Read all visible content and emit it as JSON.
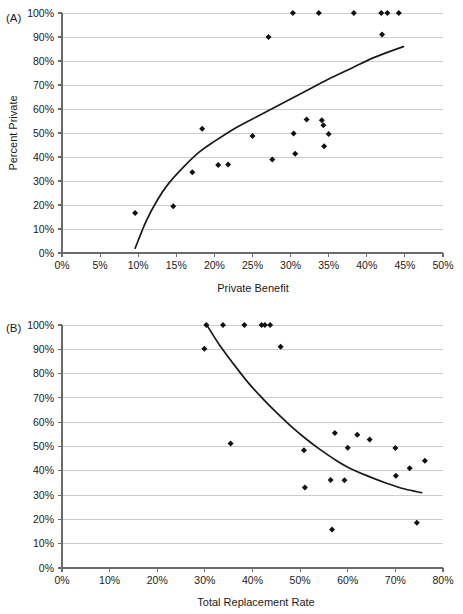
{
  "figure": {
    "background": "#ffffff",
    "marker_color": "#111111",
    "gridline_color": "#c8c8c8",
    "axis_color": "#6b6b6b",
    "fitline_color": "#1a1a1a"
  },
  "panels": [
    {
      "tag": "(A)",
      "xlabel": "Private Benefit",
      "ylabel": "Percent Private",
      "xticks": [
        "0%",
        "5%",
        "10%",
        "15%",
        "20%",
        "25%",
        "30%",
        "35%",
        "40%",
        "45%",
        "50%"
      ],
      "yticks": [
        "0%",
        "10%",
        "20%",
        "30%",
        "40%",
        "50%",
        "60%",
        "70%",
        "80%",
        "90%",
        "100%"
      ]
    },
    {
      "tag": "(B)",
      "xlabel": "Total Replacement Rate",
      "ylabel": "Percent Private",
      "xticks": [
        "0%",
        "10%",
        "20%",
        "30%",
        "40%",
        "50%",
        "60%",
        "70%",
        "80%"
      ],
      "yticks": [
        "0%",
        "10%",
        "20%",
        "30%",
        "40%",
        "50%",
        "60%",
        "70%",
        "80%",
        "90%",
        "100%"
      ]
    }
  ],
  "chart_data": [
    {
      "type": "scatter",
      "panel": "(A)",
      "title": "",
      "xlabel": "Private Benefit",
      "ylabel": "Percent Private",
      "xlim": [
        0,
        50
      ],
      "ylim": [
        0,
        100
      ],
      "xticks": [
        0,
        5,
        10,
        15,
        20,
        25,
        30,
        35,
        40,
        45,
        50
      ],
      "yticks": [
        0,
        10,
        20,
        30,
        40,
        50,
        60,
        70,
        80,
        90,
        100
      ],
      "xtick_format": "percent",
      "ytick_format": "percent",
      "grid": "horizontal",
      "legend": "none",
      "points": [
        {
          "x": 9.6,
          "y": 16.7
        },
        {
          "x": 14.6,
          "y": 19.5
        },
        {
          "x": 17.1,
          "y": 33.6
        },
        {
          "x": 18.4,
          "y": 51.8
        },
        {
          "x": 20.5,
          "y": 36.7
        },
        {
          "x": 21.8,
          "y": 36.9
        },
        {
          "x": 25.0,
          "y": 48.7
        },
        {
          "x": 27.1,
          "y": 90.0
        },
        {
          "x": 27.6,
          "y": 39.0
        },
        {
          "x": 30.3,
          "y": 100.0
        },
        {
          "x": 30.4,
          "y": 49.8
        },
        {
          "x": 30.6,
          "y": 41.4
        },
        {
          "x": 32.1,
          "y": 55.6
        },
        {
          "x": 33.7,
          "y": 100.0
        },
        {
          "x": 34.1,
          "y": 55.3
        },
        {
          "x": 34.3,
          "y": 53.2
        },
        {
          "x": 34.4,
          "y": 44.5
        },
        {
          "x": 35.0,
          "y": 49.6
        },
        {
          "x": 38.3,
          "y": 100.0
        },
        {
          "x": 41.9,
          "y": 100.0
        },
        {
          "x": 42.0,
          "y": 91.0
        },
        {
          "x": 42.7,
          "y": 100.0
        },
        {
          "x": 44.2,
          "y": 100.0
        }
      ],
      "fit_curve": {
        "description": "concave increasing logarithmic trend line",
        "x_start": 9.6,
        "x_end": 44.8,
        "points": [
          {
            "x": 9.6,
            "y": 2.0
          },
          {
            "x": 11.0,
            "y": 13.0
          },
          {
            "x": 12.5,
            "y": 22.0
          },
          {
            "x": 14.0,
            "y": 29.0
          },
          {
            "x": 16.0,
            "y": 36.0
          },
          {
            "x": 18.0,
            "y": 42.0
          },
          {
            "x": 20.0,
            "y": 46.5
          },
          {
            "x": 23.0,
            "y": 52.5
          },
          {
            "x": 26.0,
            "y": 57.5
          },
          {
            "x": 29.0,
            "y": 62.5
          },
          {
            "x": 32.0,
            "y": 67.5
          },
          {
            "x": 35.0,
            "y": 72.5
          },
          {
            "x": 38.0,
            "y": 77.0
          },
          {
            "x": 41.0,
            "y": 81.5
          },
          {
            "x": 44.8,
            "y": 86.0
          }
        ]
      }
    },
    {
      "type": "scatter",
      "panel": "(B)",
      "title": "",
      "xlabel": "Total Replacement Rate",
      "ylabel": "Percent Private",
      "xlim": [
        0,
        80
      ],
      "ylim": [
        0,
        100
      ],
      "xticks": [
        0,
        10,
        20,
        30,
        40,
        50,
        60,
        70,
        80
      ],
      "yticks": [
        0,
        10,
        20,
        30,
        40,
        50,
        60,
        70,
        80,
        90,
        100
      ],
      "xtick_format": "percent",
      "ytick_format": "percent",
      "grid": "horizontal",
      "legend": "none",
      "points": [
        {
          "x": 29.9,
          "y": 90.2
        },
        {
          "x": 30.3,
          "y": 100.0
        },
        {
          "x": 33.8,
          "y": 100.0
        },
        {
          "x": 35.4,
          "y": 51.2
        },
        {
          "x": 38.3,
          "y": 100.0
        },
        {
          "x": 41.9,
          "y": 100.0
        },
        {
          "x": 42.6,
          "y": 100.0
        },
        {
          "x": 43.7,
          "y": 100.0
        },
        {
          "x": 45.9,
          "y": 91.0
        },
        {
          "x": 50.8,
          "y": 48.5
        },
        {
          "x": 51.0,
          "y": 33.1
        },
        {
          "x": 56.4,
          "y": 36.2
        },
        {
          "x": 56.7,
          "y": 15.8
        },
        {
          "x": 57.3,
          "y": 55.6
        },
        {
          "x": 59.3,
          "y": 36.1
        },
        {
          "x": 60.0,
          "y": 49.5
        },
        {
          "x": 62.0,
          "y": 54.8
        },
        {
          "x": 64.6,
          "y": 52.9
        },
        {
          "x": 70.0,
          "y": 49.4
        },
        {
          "x": 70.1,
          "y": 38.0
        },
        {
          "x": 73.0,
          "y": 41.0
        },
        {
          "x": 74.5,
          "y": 18.6
        },
        {
          "x": 76.2,
          "y": 44.1
        }
      ],
      "fit_curve": {
        "description": "concave decreasing trend line",
        "x_start": 30.4,
        "x_end": 75.5,
        "points": [
          {
            "x": 30.4,
            "y": 100.0
          },
          {
            "x": 33.0,
            "y": 92.0
          },
          {
            "x": 36.0,
            "y": 84.0
          },
          {
            "x": 39.0,
            "y": 76.5
          },
          {
            "x": 42.0,
            "y": 70.0
          },
          {
            "x": 45.0,
            "y": 64.0
          },
          {
            "x": 48.0,
            "y": 58.5
          },
          {
            "x": 51.0,
            "y": 53.5
          },
          {
            "x": 54.0,
            "y": 49.0
          },
          {
            "x": 57.0,
            "y": 45.0
          },
          {
            "x": 60.0,
            "y": 41.5
          },
          {
            "x": 64.0,
            "y": 38.0
          },
          {
            "x": 68.0,
            "y": 35.0
          },
          {
            "x": 72.0,
            "y": 32.5
          },
          {
            "x": 75.5,
            "y": 31.0
          }
        ]
      }
    }
  ]
}
